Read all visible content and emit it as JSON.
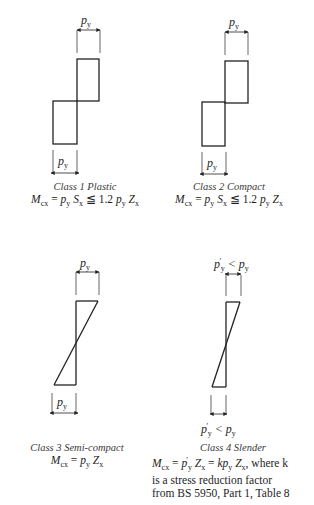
{
  "figure": {
    "panels": [
      {
        "id": "class1",
        "title": "Class 1  Plastic",
        "equation": "M_cx = p_y S_x ≦ 1.2 p_y Z_x",
        "top_dimension_label": "p_y",
        "bottom_dimension_label": "p_y",
        "stress_block": "rectangular (full plastic)"
      },
      {
        "id": "class2",
        "title": "Class 2  Compact",
        "equation": "M_cx = p_y S_x ≦ 1.2 p_y Z_x",
        "top_dimension_label": "p_y",
        "bottom_dimension_label": "p_y",
        "stress_block": "rectangular (full plastic)"
      },
      {
        "id": "class3",
        "title": "Class 3  Semi-compact",
        "equation": "M_cx = p_y Z_x",
        "top_dimension_label": "p_y",
        "bottom_dimension_label": "p_y",
        "stress_block": "triangular (elastic)"
      },
      {
        "id": "class4",
        "title": "Class 4  Slender",
        "equation": "M_cx = p'_y Z_x = k p_y Z_x, where k",
        "note_lines": [
          "is a stress reduction factor",
          "from BS 5950, Part 1, Table 8"
        ],
        "top_dimension_label": "p'_y < p_y",
        "bottom_dimension_label": "p'_y < p_y",
        "stress_block": "triangular (reduced elastic)"
      }
    ],
    "text": {
      "py": "p",
      "y_sub": "y",
      "x_sub": "x",
      "cx_sub": "cx",
      "prime": "′",
      "lt": " < ",
      "c1_title": "Class 1  Plastic",
      "c2_title": "Class 2  Compact",
      "c3_title": "Class 3  Semi-compact",
      "c4_title": "Class 4  Slender",
      "M": "M",
      "S": "S",
      "Z": "Z",
      "k": "k",
      "eq_sign": " = ",
      "leq": " ≦ 1.2 ",
      "where_k": ", where k",
      "note1": "is a stress reduction factor",
      "note2": "from BS 5950, Part 1, Table 8"
    }
  }
}
